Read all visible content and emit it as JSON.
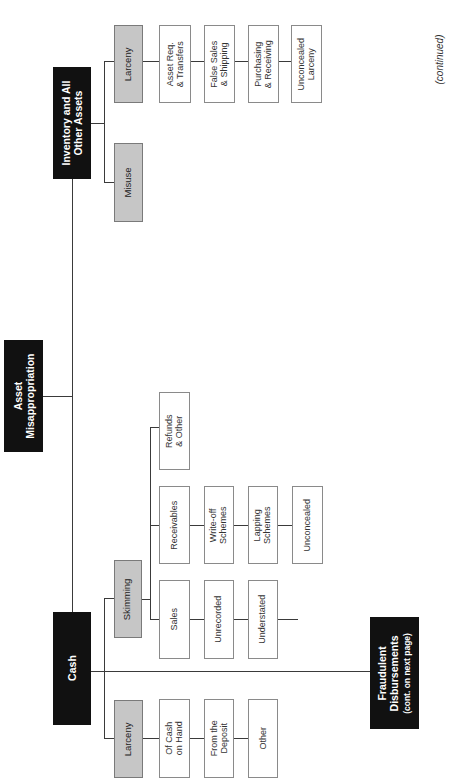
{
  "diagram": {
    "root": "Asset\nMisappropriation",
    "cash": {
      "label": "Cash",
      "larceny": {
        "label": "Larceny",
        "children": [
          "Of Cash\non Hand",
          "From the\nDeposit",
          "Other"
        ]
      },
      "skimming": {
        "label": "Skimming",
        "sales": {
          "label": "Sales",
          "children": [
            "Unrecorded",
            "Understated"
          ]
        },
        "receivables": {
          "label": "Receivables",
          "children": [
            "Write-off\nSchemes",
            "Lapping\nSchemes",
            "Unconcealed"
          ]
        },
        "refunds": {
          "label": "Refunds\n& Other"
        }
      },
      "fraudulent": {
        "title": "Fraudulent\nDisbursements",
        "note": "(cont. on next page)"
      }
    },
    "inventory": {
      "label": "Inventory and All\nOther Assets",
      "misuse": {
        "label": "Misuse"
      },
      "larceny": {
        "label": "Larceny",
        "children": [
          "Asset Req.\n& Transfers",
          "False Sales\n& Shipping",
          "Purchasing\n& Receiving",
          "Unconcealed\nLarceny"
        ]
      }
    },
    "continued": "(continued)"
  },
  "colors": {
    "primary_box": "#111111",
    "secondary_box": "#c6c6c6",
    "leaf_box": "#ffffff",
    "connector": "#3a3a3a"
  }
}
